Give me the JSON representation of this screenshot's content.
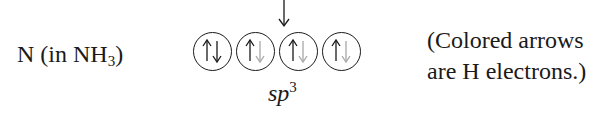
{
  "atom_label": {
    "text": "N (in NH",
    "subscript": "3",
    "suffix": ")"
  },
  "incoming_arrow": {
    "direction": "down",
    "icon": "down-arrow-icon"
  },
  "orbitals": [
    {
      "up": "own",
      "down": "own"
    },
    {
      "up": "own",
      "down": "H"
    },
    {
      "up": "own",
      "down": "H"
    },
    {
      "up": "own",
      "down": "H"
    }
  ],
  "hybridization": {
    "base": "sp",
    "superscript": "3"
  },
  "note": {
    "line1": "(Colored arrows",
    "line2": "are H electrons.)"
  },
  "colors": {
    "own_electron": "#1a1a1a",
    "h_electron": "#a8a8a8",
    "circle": "#1a1a1a"
  }
}
